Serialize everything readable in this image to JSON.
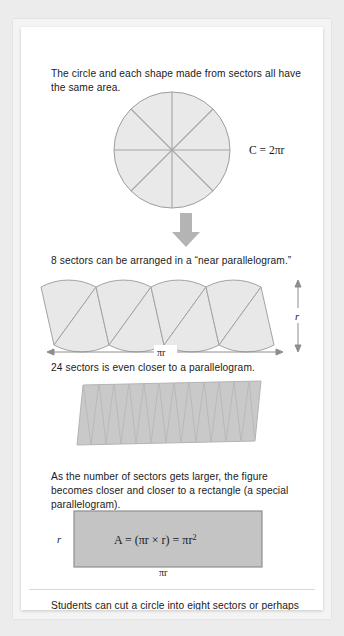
{
  "page": {
    "background_color": "#ececec",
    "card_color": "#ffffff",
    "text_color": "#1a1a1a",
    "figure_fill": "#e8e8e8",
    "figure_fill_dark": "#c6c6c6",
    "figure_stroke": "#9a9a9a",
    "arrow_color": "#b0b0b0"
  },
  "paragraphs": {
    "intro": "The circle and each shape made from sectors all have the same area.",
    "eight_sectors": "8 sectors can be arranged in a “near parallelogram.”",
    "twenty_four_sectors": "24 sectors is even closer to a parallelogram.",
    "rectangle": "As the number of sectors gets larger, the figure becomes closer and closer to a rectangle (a special parallelogram).",
    "footer": "Students can cut a circle into eight sectors or perhaps even more and rearrange them to form a near rectangle with dimensions of half the circumference by the radius."
  },
  "figures": {
    "circle": {
      "name": "circle-divided-into-8-sectors",
      "sector_count": 8,
      "circumference_label": "C = 2πr"
    },
    "arrow": {
      "name": "down-arrow",
      "direction": "down"
    },
    "parallelogram_8": {
      "name": "near-parallelogram-8-sectors",
      "sector_count": 8,
      "height_label": "r",
      "width_label": "πr"
    },
    "parallelogram_24": {
      "name": "near-parallelogram-24-sectors",
      "sector_count": 24
    },
    "rectangle": {
      "name": "limit-rectangle",
      "height_label": "r",
      "width_label": "πr",
      "area_formula": "A = (πr × r) = πr",
      "area_formula_exponent": "2"
    }
  }
}
